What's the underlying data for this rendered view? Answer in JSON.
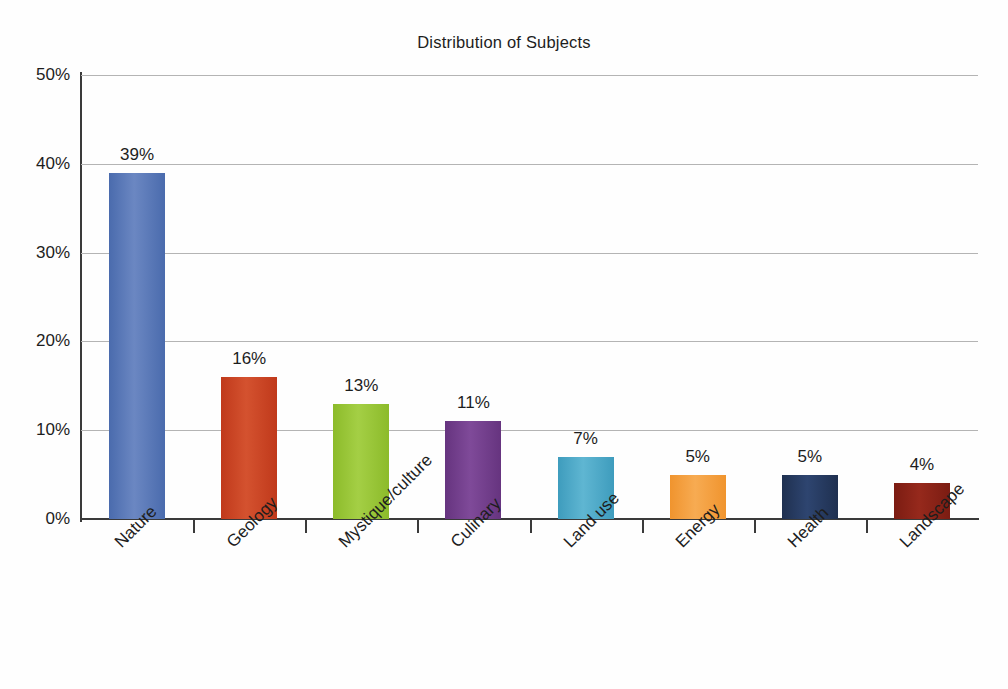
{
  "chart_data": {
    "type": "bar",
    "title": "Distribution of Subjects",
    "xlabel": "",
    "ylabel": "",
    "ylim": [
      0,
      50
    ],
    "y_tick_labels": [
      "0%",
      "10%",
      "20%",
      "30%",
      "40%",
      "50%"
    ],
    "y_tick_values": [
      0,
      10,
      20,
      30,
      40,
      50
    ],
    "grid": "horizontal",
    "legend": "none",
    "value_label_suffix": "%",
    "categories": [
      "Nature",
      "Geology",
      "Mystique/culture",
      "Culinary",
      "Land use",
      "Energy",
      "Health",
      "Landscape"
    ],
    "values": [
      39,
      16,
      13,
      11,
      7,
      5,
      5,
      4
    ],
    "value_labels": [
      "39%",
      "16%",
      "13%",
      "11%",
      "7%",
      "5%",
      "5%",
      "4%"
    ],
    "bar_colors": [
      "#4a6bad",
      "#c0391b",
      "#8cbb2a",
      "#66347f",
      "#3e9cbd",
      "#f0942e",
      "#1f3050",
      "#7b1c12"
    ],
    "bar_colors_light": [
      "#6b87c2",
      "#d4522f",
      "#a4cf45",
      "#7f4a99",
      "#5fb6d2",
      "#f7ab52",
      "#2e4570",
      "#96291c"
    ],
    "axis_color": "#3a3a3a",
    "gridline_color": "#b4b4b4",
    "text_color": "#1d1d1d",
    "background_color": "#fefefe"
  }
}
